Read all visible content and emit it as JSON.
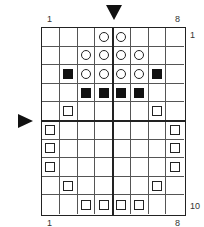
{
  "labels": {
    "top_left": "1",
    "top_right": "8",
    "right_top": "1",
    "right_bottom": "10",
    "bottom_left": "1",
    "bottom_right": "8"
  },
  "grid": {
    "columns": 8,
    "rows": 10,
    "legend": {
      "O": "circle",
      "B": "filled-square",
      "S": "open-square",
      ".": "empty"
    },
    "pattern": [
      "...OO...",
      "..OOOO..",
      ".BOOOOB.",
      "..BBBB..",
      ".S....S.",
      "S......S",
      "S......S",
      "S......S",
      ".S....S.",
      "..SSSS.."
    ]
  },
  "markers": {
    "column_marker": "down-arrow between columns 4 and 5",
    "row_marker": "right-arrow between rows 5 and 6"
  }
}
